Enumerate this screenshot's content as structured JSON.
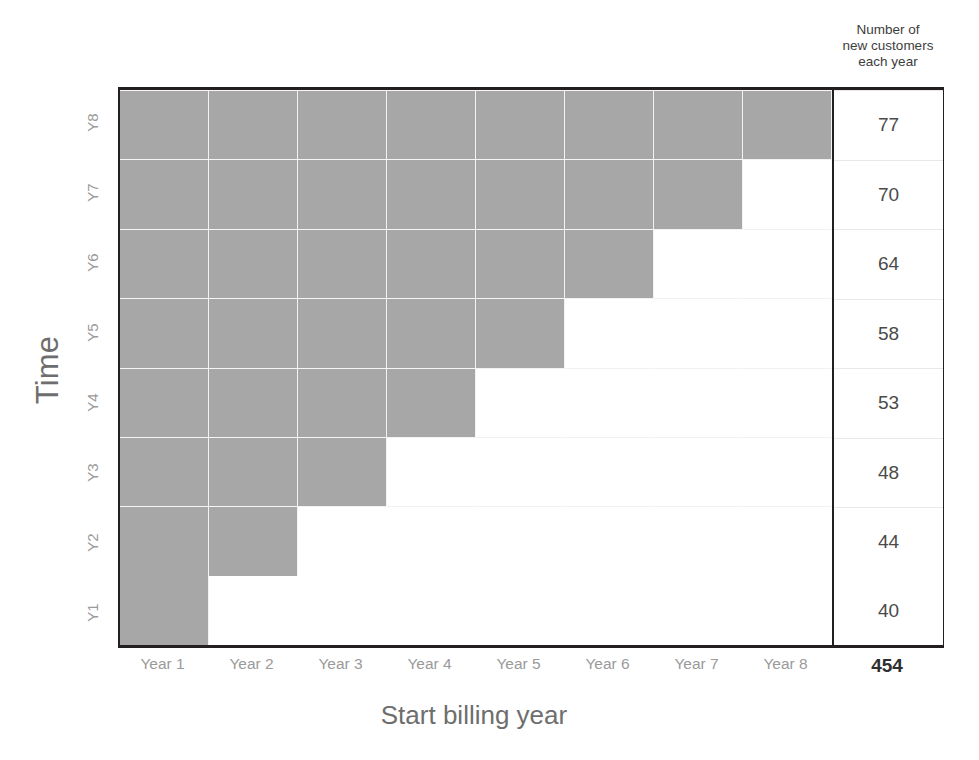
{
  "chart_data": {
    "type": "heatmap",
    "title": "",
    "xlabel": "Start billing year",
    "ylabel": "Time",
    "categories": [
      "Year 1",
      "Year 2",
      "Year 3",
      "Year 4",
      "Year 5",
      "Year 6",
      "Year 7",
      "Year 8"
    ],
    "row_labels": [
      "Y1",
      "Y2",
      "Y3",
      "Y4",
      "Y5",
      "Y6",
      "Y7",
      "Y8"
    ],
    "grid": true,
    "legend": "none",
    "fill_color": "#a7a7a7",
    "empty_color": "#ffffff",
    "matrix": [
      [
        1,
        0,
        0,
        0,
        0,
        0,
        0,
        0
      ],
      [
        1,
        1,
        0,
        0,
        0,
        0,
        0,
        0
      ],
      [
        1,
        1,
        1,
        0,
        0,
        0,
        0,
        0
      ],
      [
        1,
        1,
        1,
        1,
        0,
        0,
        0,
        0
      ],
      [
        1,
        1,
        1,
        1,
        1,
        0,
        0,
        0
      ],
      [
        1,
        1,
        1,
        1,
        1,
        1,
        0,
        0
      ],
      [
        1,
        1,
        1,
        1,
        1,
        1,
        1,
        0
      ],
      [
        1,
        1,
        1,
        1,
        1,
        1,
        1,
        1
      ]
    ],
    "values": [
      40,
      44,
      48,
      53,
      58,
      64,
      70,
      77
    ],
    "values_label": "Number of new customers each year",
    "total": 454
  },
  "axes": {
    "y_title": "Time",
    "x_title": "Start billing year",
    "y_ticks": [
      "Y1",
      "Y2",
      "Y3",
      "Y4",
      "Y5",
      "Y6",
      "Y7",
      "Y8"
    ],
    "x_ticks": [
      "Year 1",
      "Year 2",
      "Year 3",
      "Year 4",
      "Year 5",
      "Year 6",
      "Year 7",
      "Year 8"
    ]
  },
  "values_column": {
    "header_line1": "Number of",
    "header_line2": "new customers",
    "header_line3": "each year",
    "cells": [
      "40",
      "44",
      "48",
      "53",
      "58",
      "64",
      "70",
      "77"
    ],
    "total": "454"
  }
}
